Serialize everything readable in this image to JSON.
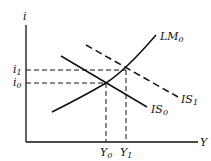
{
  "diagram": {
    "axes": {
      "y_label": "i",
      "x_label": "Y"
    },
    "curves": [
      {
        "id": "LM0",
        "label": "LM",
        "subscript": "0",
        "style": "solid"
      },
      {
        "id": "IS0",
        "label": "IS",
        "subscript": "0",
        "style": "solid"
      },
      {
        "id": "IS1",
        "label": "IS",
        "subscript": "1",
        "style": "dashed"
      }
    ],
    "y_ticks": [
      {
        "label": "i",
        "subscript": "1"
      },
      {
        "label": "i",
        "subscript": "0"
      }
    ],
    "x_ticks": [
      {
        "label": "Y",
        "subscript": "0"
      },
      {
        "label": "Y",
        "subscript": "1"
      }
    ],
    "colors": {
      "line": "#111111",
      "background": "#ffffff"
    }
  }
}
